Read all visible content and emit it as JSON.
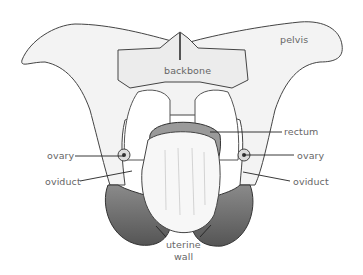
{
  "diagram": {
    "labels": {
      "pelvis": "pelvis",
      "backbone": "backbone",
      "rectum": "rectum",
      "ovary_left": "ovary",
      "ovary_right": "ovary",
      "oviduct_left": "oviduct",
      "oviduct_right": "oviduct",
      "uterine_wall_line1": "uterine",
      "uterine_wall_line2": "wall"
    },
    "colors": {
      "label_text": "#666666",
      "leader_line": "#222222",
      "bone_fill": "#f2f2f2",
      "bone_stroke": "#444444",
      "uterus_fill": "#6e6e6e",
      "hand_fill": "#f7f7f7"
    }
  }
}
